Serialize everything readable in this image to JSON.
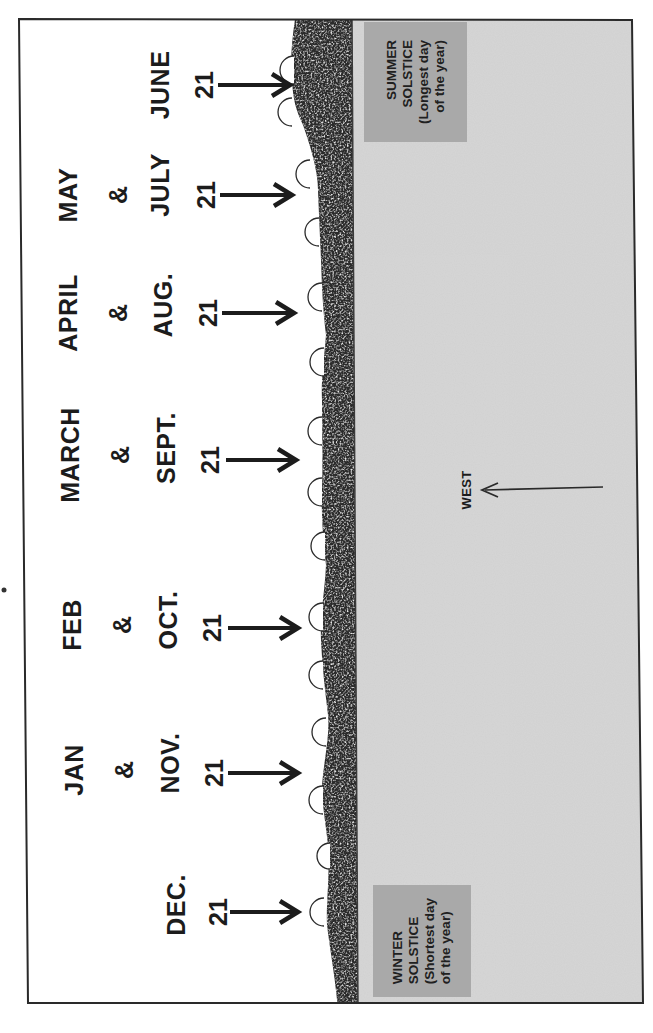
{
  "diagram": {
    "orientation": "rotated -90deg (text reads bottom-to-top)",
    "colors": {
      "paper": "#ffffff",
      "frame": "#2a2a2a",
      "sky": "#d2d2d2",
      "ground_dark": "#2b2b2b",
      "ground_light": "#d8d8d8",
      "label_box": "#a9a9a9",
      "text": "#1c1c1c"
    },
    "sunrise_groups": [
      {
        "top_month": "",
        "amp": "",
        "month": "JUNE",
        "day": "21",
        "y": 85
      },
      {
        "top_month": "MAY",
        "amp": "&",
        "month": "JULY",
        "day": "21",
        "y": 195
      },
      {
        "top_month": "APRIL",
        "amp": "&",
        "month": "AUG.",
        "day": "21",
        "y": 313
      },
      {
        "top_month": "MARCH",
        "amp": "&",
        "month": "SEPT.",
        "day": "21",
        "y": 460
      },
      {
        "top_month": "FEB",
        "amp": "&",
        "month": "OCT.",
        "day": "21",
        "y": 628
      },
      {
        "top_month": "JAN",
        "amp": "&",
        "month": "NOV.",
        "day": "21",
        "y": 773
      },
      {
        "top_month": "",
        "amp": "",
        "month": "DEC.",
        "day": "21",
        "y": 912
      }
    ],
    "sun_positions_y": [
      70,
      112,
      173,
      230,
      295,
      360,
      430,
      490,
      545,
      615,
      675,
      730,
      800,
      912
    ],
    "summer_solstice": {
      "line1": "SUMMER",
      "line2": "SOLSTICE",
      "line3": "(Longest day",
      "line4": "of the year)"
    },
    "winter_solstice": {
      "line1": "WINTER",
      "line2": "SOLSTICE",
      "line3": "(Shortest day",
      "line4": "of the year)"
    },
    "direction": {
      "label": "WEST"
    }
  }
}
